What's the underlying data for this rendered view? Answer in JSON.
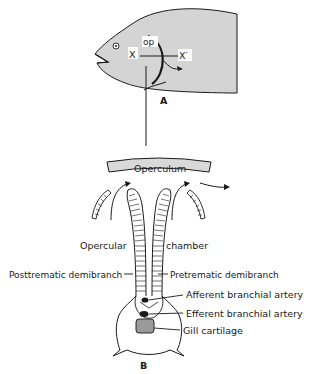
{
  "figure": {
    "panel_a": {
      "label": "A",
      "markers": {
        "x_left": "X",
        "x_right": "X′",
        "operculum_abbrev": "op"
      }
    },
    "panel_b": {
      "label": "B",
      "labels": {
        "operculum": "Operculum",
        "opercular": "Opercular",
        "chamber": "chamber",
        "posttrematic": "Posttrematic demibranch",
        "pretrematic": "Pretrematic demibranch",
        "afferent": "Afferent branchial artery",
        "efferent": "Efferent branchial artery",
        "cartilage": "Gill cartilage"
      }
    }
  },
  "colors": {
    "fish_body": "#d4d4d4",
    "outline": "#1a1a1a",
    "cartilage": "#9a9a9a",
    "operculum_fill": "#d9d9d9"
  }
}
